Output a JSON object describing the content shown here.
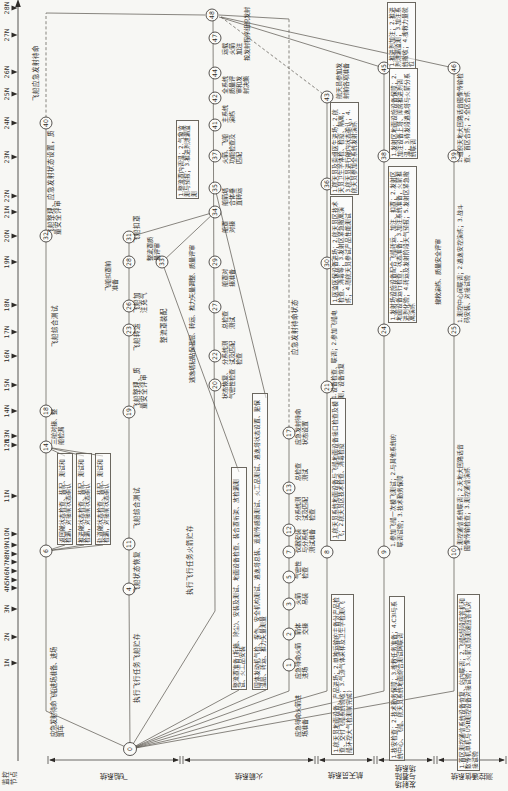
{
  "canvas": {
    "w": 508,
    "h": 791,
    "bg": "#f7f7f4",
    "ink": "#2e2b28",
    "line": "#57534c"
  },
  "axis": {
    "label_lines": [
      "监控",
      "节点"
    ],
    "y": 18,
    "x1": 30,
    "x2": 786,
    "ticks": [
      {
        "label": "1N",
        "x": 128
      },
      {
        "label": "2N",
        "x": 154
      },
      {
        "label": "3N",
        "x": 182
      },
      {
        "label": "4N",
        "x": 203
      },
      {
        "label": "5N",
        "x": 211
      },
      {
        "label": "6N",
        "x": 220
      },
      {
        "label": "7N",
        "x": 229
      },
      {
        "label": "8N",
        "x": 237
      },
      {
        "label": "9N",
        "x": 246
      },
      {
        "label": "10N",
        "x": 257
      },
      {
        "label": "11N",
        "x": 295
      },
      {
        "label": "12N",
        "x": 346
      },
      {
        "label": "13N",
        "x": 355
      },
      {
        "label": "14N",
        "x": 380
      },
      {
        "label": "15N",
        "x": 406
      },
      {
        "label": "16N",
        "x": 435
      },
      {
        "label": "17N",
        "x": 459
      },
      {
        "label": "18N",
        "x": 486
      },
      {
        "label": "19N",
        "x": 529
      },
      {
        "label": "20N",
        "x": 555
      },
      {
        "label": "21N",
        "x": 579
      },
      {
        "label": "22N",
        "x": 595
      },
      {
        "label": "23N",
        "x": 634
      },
      {
        "label": "24N",
        "x": 668
      },
      {
        "label": "25N",
        "x": 697
      },
      {
        "label": "26N",
        "x": 719
      },
      {
        "label": "27N",
        "x": 756
      },
      {
        "label": "28N",
        "x": 783
      }
    ]
  },
  "lanes": {
    "bracket_x": 31,
    "items": [
      {
        "label": "飞船系统",
        "from": 48,
        "to": 180,
        "wide": false
      },
      {
        "label": "火箭系统",
        "from": 183,
        "to": 315,
        "wide": false
      },
      {
        "label": "航天员系统",
        "from": 318,
        "to": 374,
        "wide": false
      },
      {
        "label": "发射场与着陆场系统",
        "from": 377,
        "to": 434,
        "wide": true
      },
      {
        "label": "测控通信系统",
        "from": 437,
        "to": 506,
        "wide": false
      }
    ]
  },
  "nodes": [
    {
      "n": "0",
      "x": 42,
      "y": 130
    },
    {
      "n": "1",
      "x": 126,
      "y": 289
    },
    {
      "n": "2",
      "x": 157,
      "y": 289
    },
    {
      "n": "3",
      "x": 187,
      "y": 289
    },
    {
      "n": "4",
      "x": 202,
      "y": 129
    },
    {
      "n": "5",
      "x": 214,
      "y": 289
    },
    {
      "n": "6",
      "x": 240,
      "y": 46
    },
    {
      "n": "7",
      "x": 239,
      "y": 289
    },
    {
      "n": "8",
      "x": 239,
      "y": 327
    },
    {
      "n": "9",
      "x": 239,
      "y": 384
    },
    {
      "n": "10",
      "x": 239,
      "y": 454
    },
    {
      "n": "11",
      "x": 247,
      "y": 129
    },
    {
      "n": "12",
      "x": 261,
      "y": 289
    },
    {
      "n": "13",
      "x": 303,
      "y": 289
    },
    {
      "n": "14",
      "x": 344,
      "y": 46
    },
    {
      "n": "17",
      "x": 358,
      "y": 289
    },
    {
      "n": "18",
      "x": 380,
      "y": 46
    },
    {
      "n": "19",
      "x": 379,
      "y": 129
    },
    {
      "n": "20",
      "x": 406,
      "y": 215
    },
    {
      "n": "21",
      "x": 404,
      "y": 327
    },
    {
      "n": "22",
      "x": 435,
      "y": 215
    },
    {
      "n": "23",
      "x": 461,
      "y": 129
    },
    {
      "n": "24",
      "x": 461,
      "y": 384
    },
    {
      "n": "25",
      "x": 461,
      "y": 454
    },
    {
      "n": "26",
      "x": 485,
      "y": 129
    },
    {
      "n": "27",
      "x": 484,
      "y": 215
    },
    {
      "n": "28",
      "x": 529,
      "y": 129
    },
    {
      "n": "29",
      "x": 529,
      "y": 215
    },
    {
      "n": "30",
      "x": 528,
      "y": 327
    },
    {
      "n": "31",
      "x": 554,
      "y": 129
    },
    {
      "n": "32",
      "x": 555,
      "y": 46
    },
    {
      "n": "33",
      "x": 529,
      "y": 162
    },
    {
      "n": "34",
      "x": 579,
      "y": 215
    },
    {
      "n": "35",
      "x": 603,
      "y": 215
    },
    {
      "n": "36",
      "x": 607,
      "y": 327
    },
    {
      "n": "37",
      "x": 635,
      "y": 215
    },
    {
      "n": "38",
      "x": 635,
      "y": 384
    },
    {
      "n": "39",
      "x": 635,
      "y": 454
    },
    {
      "n": "40",
      "x": 668,
      "y": 46
    },
    {
      "n": "41",
      "x": 666,
      "y": 215
    },
    {
      "n": "42",
      "x": 693,
      "y": 215
    },
    {
      "n": "43",
      "x": 694,
      "y": 327
    },
    {
      "n": "44",
      "x": 718,
      "y": 215
    },
    {
      "n": "45",
      "x": 723,
      "y": 384
    },
    {
      "n": "46",
      "x": 723,
      "y": 454
    },
    {
      "n": "47",
      "x": 753,
      "y": 215
    },
    {
      "n": "48",
      "x": 776,
      "y": 212
    }
  ],
  "edges": [
    {
      "name": "spacecraft-standby-entry",
      "dash": false,
      "pts": [
        [
          42,
          130
        ],
        [
          80,
          46
        ],
        [
          240,
          46
        ]
      ]
    },
    {
      "name": "spacecraft-standby-line",
      "dash": false,
      "pts": [
        [
          240,
          46
        ],
        [
          668,
          46
        ]
      ]
    },
    {
      "name": "spacecraft-standby-wait",
      "dash": true,
      "pts": [
        [
          668,
          46
        ],
        [
          778,
          46
        ]
      ]
    },
    {
      "name": "spacecraft-standby-merge",
      "dash": false,
      "pts": [
        [
          778,
          46
        ],
        [
          776,
          205
        ]
      ]
    },
    {
      "name": "spacecraft-mission-line",
      "dash": false,
      "pts": [
        [
          42,
          130
        ],
        [
          202,
          129
        ],
        [
          554,
          129
        ]
      ]
    },
    {
      "name": "spacecraft-to-mate",
      "dash": false,
      "pts": [
        [
          554,
          129
        ],
        [
          579,
          215
        ]
      ]
    },
    {
      "name": "fairing-entry",
      "dash": false,
      "pts": [
        [
          42,
          130
        ],
        [
          101,
          239
        ]
      ]
    },
    {
      "name": "fairing-mid",
      "dash": false,
      "pts": [
        [
          319,
          239
        ],
        [
          529,
          162
        ]
      ]
    },
    {
      "name": "fairing-to-mate",
      "dash": false,
      "pts": [
        [
          529,
          162
        ],
        [
          579,
          215
        ]
      ]
    },
    {
      "name": "escape-tower-entry",
      "dash": false,
      "pts": [
        [
          42,
          130
        ],
        [
          101,
          266
        ]
      ]
    },
    {
      "name": "escape-tower-to-35",
      "dash": false,
      "pts": [
        [
          393,
          266
        ],
        [
          603,
          215
        ]
      ]
    },
    {
      "name": "rocket-mission-line",
      "dash": false,
      "pts": [
        [
          42,
          130
        ],
        [
          180,
          215
        ],
        [
          776,
          213
        ]
      ]
    },
    {
      "name": "rocket-standby-line",
      "dash": false,
      "pts": [
        [
          42,
          130
        ],
        [
          100,
          289
        ],
        [
          358,
          289
        ]
      ]
    },
    {
      "name": "rocket-standby-wait",
      "dash": true,
      "pts": [
        [
          358,
          289
        ],
        [
          772,
          289
        ]
      ]
    },
    {
      "name": "rocket-standby-merge",
      "dash": false,
      "pts": [
        [
          772,
          289
        ],
        [
          776,
          219
        ]
      ]
    },
    {
      "name": "astronaut-line",
      "dash": false,
      "pts": [
        [
          42,
          130
        ],
        [
          100,
          327
        ],
        [
          694,
          327
        ]
      ]
    },
    {
      "name": "astronaut-merge",
      "dash": true,
      "pts": [
        [
          694,
          327
        ],
        [
          774,
          221
        ]
      ]
    },
    {
      "name": "launchsite-line",
      "dash": false,
      "pts": [
        [
          42,
          130
        ],
        [
          100,
          384
        ],
        [
          723,
          384
        ]
      ]
    },
    {
      "name": "launchsite-merge",
      "dash": false,
      "pts": [
        [
          723,
          384
        ],
        [
          774,
          219
        ]
      ]
    },
    {
      "name": "ttc-line",
      "dash": false,
      "pts": [
        [
          42,
          130
        ],
        [
          100,
          454
        ],
        [
          723,
          454
        ]
      ]
    },
    {
      "name": "ttc-merge",
      "dash": false,
      "pts": [
        [
          723,
          454
        ],
        [
          774,
          221
        ]
      ]
    },
    {
      "name": "module-fan-1",
      "dash": false,
      "pts": [
        [
          240,
          46
        ],
        [
          246,
          65
        ]
      ]
    },
    {
      "name": "module-fan-2",
      "dash": false,
      "pts": [
        [
          240,
          46
        ],
        [
          246,
          84
        ]
      ]
    },
    {
      "name": "module-fan-3",
      "dash": false,
      "pts": [
        [
          240,
          46
        ],
        [
          246,
          103
        ]
      ]
    },
    {
      "name": "module-join-1",
      "dash": false,
      "pts": [
        [
          335,
          65
        ],
        [
          344,
          46
        ]
      ]
    },
    {
      "name": "module-join-2",
      "dash": false,
      "pts": [
        [
          335,
          84
        ],
        [
          344,
          46
        ]
      ]
    },
    {
      "name": "module-join-3",
      "dash": false,
      "pts": [
        [
          335,
          103
        ],
        [
          344,
          46
        ]
      ]
    }
  ],
  "labels": [
    {
      "t": "应急发射待命飞船进场准备、进场卸车",
      "x": 54,
      "y": 50,
      "w": 92,
      "fs": 6.3,
      "box": false
    },
    {
      "t": "返回舱状态检查、装配、测试和检漏，对接前状态确认",
      "x": 246,
      "y": 57,
      "w": 87,
      "fs": 5.8,
      "box": true
    },
    {
      "t": "推进舱状态检查、装配、测试和检漏，对接前状态确认",
      "x": 246,
      "y": 76,
      "w": 87,
      "fs": 5.8,
      "box": true
    },
    {
      "t": "轨道舱状态检查、装配、测试和检漏，对接前状态确认",
      "x": 246,
      "y": 95,
      "w": 87,
      "fs": 5.8,
      "box": true
    },
    {
      "t": "三舱对接、整船检漏",
      "x": 346,
      "y": 50,
      "w": 40,
      "fs": 6.2,
      "box": false
    },
    {
      "t": "飞船综合测试",
      "x": 444,
      "y": 52,
      "fs": 6.5,
      "box": false,
      "nw": true
    },
    {
      "t": "飞船整理、应急发射状态设置，质量安全评审",
      "x": 556,
      "y": 48,
      "w": 105,
      "fs": 6.5,
      "box": false
    },
    {
      "t": "飞船应急发射待命",
      "x": 690,
      "y": 33,
      "fs": 6.5,
      "box": false,
      "nw": true
    },
    {
      "t": "执行飞行任务飞船贮存",
      "x": 88,
      "y": 134,
      "fs": 6.5,
      "box": false,
      "nw": true
    },
    {
      "t": "飞船状态恢复",
      "x": 198,
      "y": 134,
      "fs": 6.5,
      "box": false,
      "nw": true
    },
    {
      "t": "飞船综合测试",
      "x": 262,
      "y": 134,
      "fs": 6.5,
      "box": false,
      "nw": true
    },
    {
      "t": "飞船整理、质量安全评审",
      "x": 382,
      "y": 134,
      "w": 47,
      "fs": 6.5,
      "box": false
    },
    {
      "t": "飞船转运",
      "x": 440,
      "y": 134,
      "fs": 6.5,
      "box": false,
      "nw": true
    },
    {
      "t": "飞船加注充气",
      "x": 478,
      "y": 134,
      "w": 27,
      "fs": 6.5,
      "box": false
    },
    {
      "t": "飞船扣罩前准备",
      "x": 500,
      "y": 104,
      "w": 30,
      "fs": 6.2,
      "box": false
    },
    {
      "t": "飞船扣罩",
      "x": 548,
      "y": 134,
      "fs": 6.5,
      "box": false,
      "nw": true
    },
    {
      "t": "整流罩准备(拆箱、除尘)、安装及测试、地面设备检查、装合罩桁架、放检漏测试、火工品安装",
      "x": 101,
      "y": 231,
      "w": 218,
      "fs": 5.8,
      "box": true
    },
    {
      "t": "固体发动机气检、探伤、安全机构测试、逃逸塔总装、遥测传感器测试、火工品测试、逃逸塔状态设置、贴保温层、转运、推力矢量测量",
      "x": 101,
      "y": 252,
      "w": 292,
      "fs": 5.8,
      "box": true
    },
    {
      "t": "整流罩装配",
      "x": 448,
      "y": 161,
      "fs": 6.5,
      "box": false,
      "nw": true
    },
    {
      "t": "整流罩质量评审",
      "x": 530,
      "y": 146,
      "w": 24,
      "fs": 6.2,
      "box": false
    },
    {
      "t": "逃逸塔粘贴保温层、转运、推力矢量调整、质量评审",
      "x": 408,
      "y": 188,
      "w": 140,
      "fs": 6.2,
      "box": false
    },
    {
      "t": "执行飞行任务火箭贮存",
      "x": 196,
      "y": 187,
      "fs": 6.5,
      "box": false,
      "nw": true
    },
    {
      "t": "状态恢复、气密性检查",
      "x": 392,
      "y": 221,
      "w": 34,
      "fs": 6.2,
      "box": false
    },
    {
      "t": "分系统测试及匹配检查",
      "x": 426,
      "y": 221,
      "w": 28,
      "fs": 6.2,
      "box": false
    },
    {
      "t": "总检查测试",
      "x": 462,
      "y": 221,
      "w": 21,
      "fs": 6.2,
      "box": false
    },
    {
      "t": "船罩对接准备",
      "x": 504,
      "y": 221,
      "w": 21,
      "fs": 6.2,
      "box": false
    },
    {
      "t": "船罩对接",
      "x": 558,
      "y": 221,
      "w": 14,
      "fs": 6.2,
      "box": false
    },
    {
      "t": "船箭塔合体垂直转运",
      "x": 585,
      "y": 221,
      "w": 21,
      "fs": 6.2,
      "box": false
    },
    {
      "t": "火箭、飞船功能检查及匹配",
      "x": 627,
      "y": 221,
      "w": 30,
      "fs": 6.2,
      "box": false
    },
    {
      "t": "主系统演练",
      "x": 668,
      "y": 221,
      "w": 21,
      "fs": 6.2,
      "box": false
    },
    {
      "t": "全系统质量评审和发射决策",
      "x": 697,
      "y": 221,
      "w": 21,
      "fs": 6.2,
      "box": false
    },
    {
      "t": "运载火箭加注",
      "x": 736,
      "y": 221,
      "w": 14,
      "fs": 6.2,
      "box": false
    },
    {
      "t": "按发射程序组织发射",
      "x": 730,
      "y": 243,
      "fs": 6.2,
      "box": false,
      "nw": true
    },
    {
      "t": "1.整流罩内调温；2.气象监测与预报；3.推进剂泄漏监测",
      "x": 592,
      "y": 176,
      "w": 74,
      "fs": 5.8,
      "box": true
    },
    {
      "t": "应急待命火箭进场准备",
      "x": 54,
      "y": 294,
      "w": 42,
      "fs": 6.2,
      "box": false
    },
    {
      "t": "应急待命火箭进场",
      "x": 112,
      "y": 294,
      "w": 36,
      "fs": 6.2,
      "box": false
    },
    {
      "t": "箭体交接",
      "x": 156,
      "y": 294,
      "w": 14,
      "fs": 6.2,
      "box": false
    },
    {
      "t": "火箭吊装",
      "x": 186,
      "y": 294,
      "w": 14,
      "fs": 6.2,
      "box": false
    },
    {
      "t": "气密性检查",
      "x": 212,
      "y": 294,
      "w": 20,
      "fs": 6.2,
      "box": false
    },
    {
      "t": "仪器安装与分系统测试准备",
      "x": 238,
      "y": 294,
      "w": 26,
      "fs": 6.2,
      "box": false
    },
    {
      "t": "分系统测试及匹配检查",
      "x": 270,
      "y": 294,
      "w": 28,
      "fs": 6.2,
      "box": false
    },
    {
      "t": "总检查测试",
      "x": 310,
      "y": 294,
      "w": 20,
      "fs": 6.2,
      "box": false
    },
    {
      "t": "应急发射待命状态设置",
      "x": 346,
      "y": 294,
      "w": 40,
      "fs": 6.2,
      "box": false
    },
    {
      "t": "应急发射待命状态",
      "x": 436,
      "y": 292,
      "fs": 6.5,
      "box": false,
      "nw": true
    },
    {
      "t": "1.航天员地面设备、产品进场；2.单独运输的主备份产品检查、交付飞船系统验收；3.气源气体采样及卫生学检测(飞船环控大气检测前完成)",
      "x": 36,
      "y": 331,
      "w": 156,
      "fs": 5.8,
      "box": true
    },
    {
      "t": "1.航天员系统地面设备与飞船地面设备接口检查及模飞；2.航天员区技术检查、消毒检疫",
      "x": 250,
      "y": 330,
      "w": 138,
      "fs": 5.8,
      "box": true
    },
    {
      "t": "1.设备检查、联调；2.参加飞船电测，设备恢复",
      "x": 392,
      "y": 331,
      "w": 98,
      "fs": 5.8,
      "box": false
    },
    {
      "t": "1.医监医保设备进场；2.航天员区技术检查、消毒等；3.发射区紧急撤离演练；4.随航天员参试产品性能测试",
      "x": 486,
      "y": 330,
      "w": 104,
      "fs": 5.8,
      "box": true
    },
    {
      "t": "1.航天员及乘组医生进场；2.航天员卫生学体检、检疫、隔离；3.航天员进行舱内状态确认；4.航天员参加全系统发射演练",
      "x": 596,
      "y": 330,
      "w": 88,
      "fs": 5.8,
      "box": true
    },
    {
      "t": "航天员参加发射前各项准备",
      "x": 692,
      "y": 335,
      "w": 40,
      "fs": 6.2,
      "box": false
    },
    {
      "t": "1.技安检查；2.技术勤务保障；3.搜救任务准备；4.C3I与系统中心、飞船、航天员系统地面综合测试网联调",
      "x": 30,
      "y": 389,
      "w": 160,
      "fs": 5.8,
      "box": true
    },
    {
      "t": "1.参加飞船一次模飞测试；2.与其他系统的联调试验；3.技术勤务保障",
      "x": 244,
      "y": 390,
      "w": 118,
      "fs": 5.8,
      "box": false
    },
    {
      "t": "1.发射场设施设备配合飞船转运、加注、扣罩；2.发射区地面设备运行检查，状态准备；3.加注系统准备，火箭推进剂化验；4.转运及发射阶段天气预报；5.发射区紧急撤离演练",
      "x": 468,
      "y": 388,
      "w": 152,
      "fs": 5.8,
      "box": true
    },
    {
      "t": "搜救演练、质量安全评审",
      "x": 486,
      "y": 434,
      "fs": 6.2,
      "box": false,
      "nw": true
    },
    {
      "t": "1.发射区地面设施设备保障；2.加注设备上塔、库房推进剂调温；3.待发段逃逸塔与火箭分系统联调",
      "x": 632,
      "y": 389,
      "w": 86,
      "fs": 5.8,
      "box": true
    },
    {
      "t": "1.推进剂加注；2.推进剂泄漏监测；3.加注系统撤收；4.搜救力量就位",
      "x": 722,
      "y": 387,
      "w": 62,
      "fs": 5.8,
      "box": true
    },
    {
      "t": "1.首区测控通信系统设备恢复、站内联调；2.飞船S频段应答机和数传机单机与USB测控设备对接试验；3.火箭双频测速应答机对接试验",
      "x": 20,
      "y": 457,
      "w": 172,
      "fs": 5.8,
      "box": true
    },
    {
      "t": "1.测控通信系统联调；2.天地大回路话音图像传输检查；3.测控通信演练",
      "x": 240,
      "y": 457,
      "w": 112,
      "fs": 5.8,
      "box": false
    },
    {
      "t": "1.测控中心间联调；2.逃逸安控演练；3.战斗码安装、对接试验",
      "x": 468,
      "y": 457,
      "w": 124,
      "fs": 5.8,
      "box": false
    },
    {
      "t": "1.组织天地大回路话音图像传输检查、首区合练；2.全区合练",
      "x": 628,
      "y": 457,
      "w": 92,
      "fs": 5.8,
      "box": false
    }
  ]
}
